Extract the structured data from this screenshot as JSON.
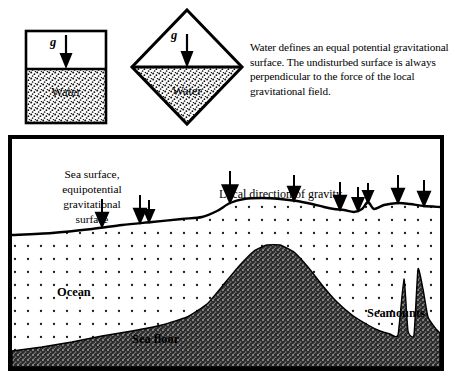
{
  "figure": {
    "title": "Water defines an equal potential gravitational surface",
    "width": 454,
    "height": 389,
    "background_color": "#ffffff",
    "ink_color": "#000000"
  },
  "caption": {
    "text": "Water defines an equal potential gravitational surface. The undisturbed surface is always perpendicular to the force of the local gravitational field."
  },
  "containers": [
    {
      "id": "square-container",
      "shape": "square",
      "water_label": "Water",
      "gravity_label": "g",
      "water_line_fraction": 0.42,
      "description": "Upright square vessel, horizontal water surface"
    },
    {
      "id": "diamond-container",
      "shape": "diamond",
      "water_label": "Water",
      "gravity_label": "g",
      "water_line_fraction": 0.5,
      "description": "Square vessel rotated 45 degrees, water surface still horizontal"
    }
  ],
  "ocean_panel": {
    "labels": {
      "sea_surface": "Sea surface,\nequipotential\ngravitational\nsurface",
      "gravity_direction": "Local direction of gravity",
      "ocean": "Ocean",
      "sea_floor": "Sea floor",
      "seamounts": "Seamounts"
    },
    "border_color": "#000000",
    "border_width_px": 4,
    "water_fill": "dotted-stipple",
    "seafloor_fill": "dark-stipple"
  },
  "chart_data": {
    "type": "area",
    "xlabel": "",
    "ylabel": "",
    "xlim": [
      0,
      428
    ],
    "ylim": [
      0,
      228
    ],
    "grid": false,
    "legend_position": "none",
    "series": [
      {
        "name": "Sea surface (equipotential)",
        "comment": "y measured downward from panel top; bulges upward (smaller y) over seamounts",
        "points": [
          [
            0,
            96
          ],
          [
            40,
            94
          ],
          [
            80,
            90
          ],
          [
            110,
            86
          ],
          [
            140,
            83
          ],
          [
            170,
            80
          ],
          [
            190,
            78
          ],
          [
            205,
            72
          ],
          [
            218,
            64
          ],
          [
            232,
            60
          ],
          [
            250,
            59
          ],
          [
            268,
            60
          ],
          [
            285,
            62
          ],
          [
            300,
            65
          ],
          [
            312,
            68
          ],
          [
            322,
            70
          ],
          [
            332,
            71
          ],
          [
            342,
            73
          ],
          [
            350,
            70
          ],
          [
            356,
            63
          ],
          [
            362,
            70
          ],
          [
            372,
            66
          ],
          [
            386,
            64
          ],
          [
            398,
            65
          ],
          [
            412,
            67
          ],
          [
            428,
            68
          ]
        ]
      },
      {
        "name": "Sea floor",
        "comment": "y measured downward from panel top; larger y = deeper",
        "points": [
          [
            0,
            212
          ],
          [
            30,
            208
          ],
          [
            60,
            203
          ],
          [
            90,
            197
          ],
          [
            120,
            192
          ],
          [
            150,
            186
          ],
          [
            175,
            178
          ],
          [
            195,
            165
          ],
          [
            212,
            145
          ],
          [
            228,
            126
          ],
          [
            242,
            112
          ],
          [
            255,
            106
          ],
          [
            268,
            106
          ],
          [
            282,
            113
          ],
          [
            296,
            128
          ],
          [
            310,
            146
          ],
          [
            324,
            162
          ],
          [
            340,
            176
          ],
          [
            356,
            186
          ],
          [
            368,
            192
          ],
          [
            378,
            195
          ],
          [
            386,
            196
          ],
          [
            392,
            140
          ],
          [
            396,
            192
          ],
          [
            402,
            196
          ],
          [
            406,
            130
          ],
          [
            411,
            150
          ],
          [
            416,
            178
          ],
          [
            424,
            190
          ],
          [
            428,
            194
          ]
        ]
      }
    ],
    "gravity_arrows": [
      {
        "x": 90,
        "surface_y": 88,
        "length": 30,
        "head_width": 15,
        "label": "g"
      },
      {
        "x": 128,
        "surface_y": 84,
        "length": 30,
        "head_width": 15,
        "label": "g"
      },
      {
        "x": 137,
        "surface_y": 83,
        "length": 24,
        "head_width": 13,
        "label": "g"
      },
      {
        "x": 218,
        "surface_y": 64,
        "length": 34,
        "head_width": 18,
        "label": "g"
      },
      {
        "x": 282,
        "surface_y": 62,
        "length": 28,
        "head_width": 15,
        "label": "g"
      },
      {
        "x": 328,
        "surface_y": 71,
        "length": 30,
        "head_width": 15,
        "label": "g"
      },
      {
        "x": 346,
        "surface_y": 72,
        "length": 26,
        "head_width": 14,
        "label": "g"
      },
      {
        "x": 356,
        "surface_y": 64,
        "length": 22,
        "head_width": 13,
        "label": "g"
      },
      {
        "x": 386,
        "surface_y": 64,
        "length": 30,
        "head_width": 15,
        "label": "g"
      },
      {
        "x": 412,
        "surface_y": 67,
        "length": 28,
        "head_width": 15,
        "label": "g"
      }
    ]
  }
}
